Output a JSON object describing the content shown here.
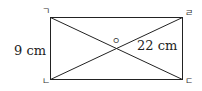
{
  "diagram": {
    "type": "rectangle-with-diagonals",
    "vertices": {
      "top_left": "ㄱ",
      "top_right": "ㄹ",
      "bottom_left": "ㄴ",
      "bottom_right": "ㄷ",
      "center": "ㅇ"
    },
    "measurements": {
      "side_height": "9 cm",
      "diagonal_segment": "22 cm"
    },
    "colors": {
      "stroke": "#222222",
      "background": "#ffffff"
    }
  }
}
